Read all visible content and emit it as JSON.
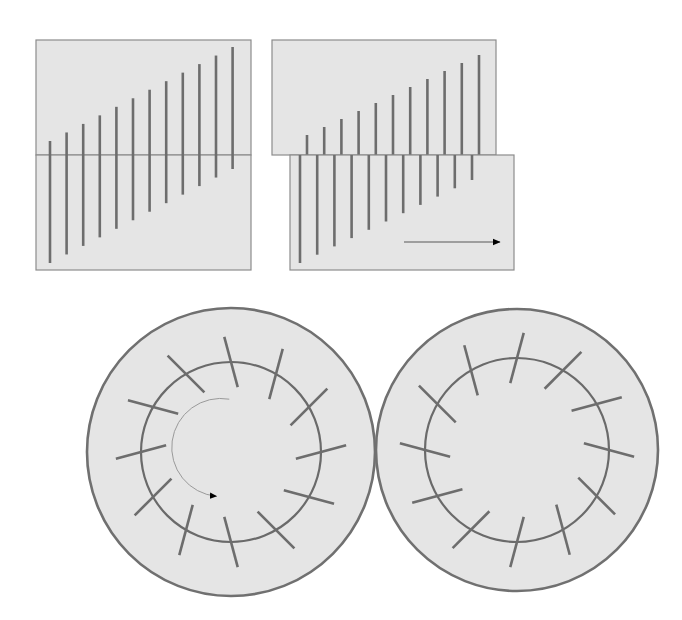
{
  "figure": {
    "width": 682,
    "height": 620,
    "background_color": "#ffffff"
  },
  "colors": {
    "panel_fill": "#e5e5e5",
    "panel_stroke": "#8c8c8c",
    "tick_stroke": "#6d6d6d",
    "circle_stroke": "#707070",
    "inner_circle_stroke": "#6a6a6a",
    "thin_arrow_stroke": "#595959",
    "arrow_head_fill": "#000000",
    "curved_arrow_stroke": "#9a9a9a"
  },
  "strokes": {
    "panel_border_width": 1.2,
    "tick_width": 2.6,
    "outer_circle_width": 2.6,
    "inner_circle_width": 2.2,
    "thin_arrow_width": 1.1,
    "curved_arrow_width": 1.0
  },
  "panels": [
    {
      "name": "top-left-rectangles",
      "label": "Undisplaced stacked rectangles",
      "rects": [
        {
          "name": "upper-rect",
          "x": 36,
          "y": 40,
          "w": 215,
          "h": 115
        },
        {
          "name": "lower-rect",
          "x": 36,
          "y": 155,
          "w": 215,
          "h": 115
        }
      ],
      "ticks": {
        "count": 12,
        "x_start": 50,
        "x_step": 16.6,
        "center_y": 155,
        "top_len_start": 14,
        "top_len_end": 108,
        "bottom_len_start": 108,
        "bottom_len_end": 14
      }
    },
    {
      "name": "top-right-rectangles",
      "label": "Displaced stacked rectangles",
      "rects": [
        {
          "name": "upper-rect",
          "x": 272,
          "y": 40,
          "w": 224,
          "h": 115
        },
        {
          "name": "lower-rect",
          "x": 290,
          "y": 155,
          "w": 224,
          "h": 115
        }
      ],
      "ticks": {
        "count": 11,
        "center_y": 155,
        "upper_x_start": 307,
        "upper_x_step": 17.2,
        "lower_x_start": 300,
        "lower_x_step": 17.2,
        "top_len_start": 20,
        "top_len_end": 100,
        "bottom_len_start": 108,
        "bottom_len_end": 25
      },
      "displacement_arrow": {
        "name": "displacement-arrow",
        "x1": 404,
        "y1": 242,
        "x2": 500,
        "y2": 242,
        "direction": "right"
      }
    },
    {
      "name": "bottom-left-circles",
      "label": "Rotating annulus with ticks",
      "outer_circle": {
        "cx": 231,
        "cy": 452,
        "r": 144
      },
      "inner_circle": {
        "cx": 231,
        "cy": 452,
        "r": 90
      },
      "ticks": {
        "count": 12,
        "inner_offset": -26,
        "outer_offset": 26,
        "tilt_degrees": -15,
        "start_angle_degrees": -90
      },
      "rotation_arrow": {
        "name": "rotation-arrow",
        "cx": 225,
        "cy": 448,
        "r": 49,
        "start_angle_degrees": 100,
        "end_angle_degrees": 275,
        "direction": "counter-clockwise"
      }
    },
    {
      "name": "bottom-right-circles",
      "label": "Static annulus with ticks",
      "outer_circle": {
        "cx": 517,
        "cy": 450,
        "r": 141
      },
      "inner_circle": {
        "cx": 517,
        "cy": 450,
        "r": 92
      },
      "ticks": {
        "count": 12,
        "inner_offset": -26,
        "outer_offset": 26,
        "tilt_degrees": 15,
        "start_angle_degrees": -90
      },
      "rotation_arrow": null
    }
  ]
}
